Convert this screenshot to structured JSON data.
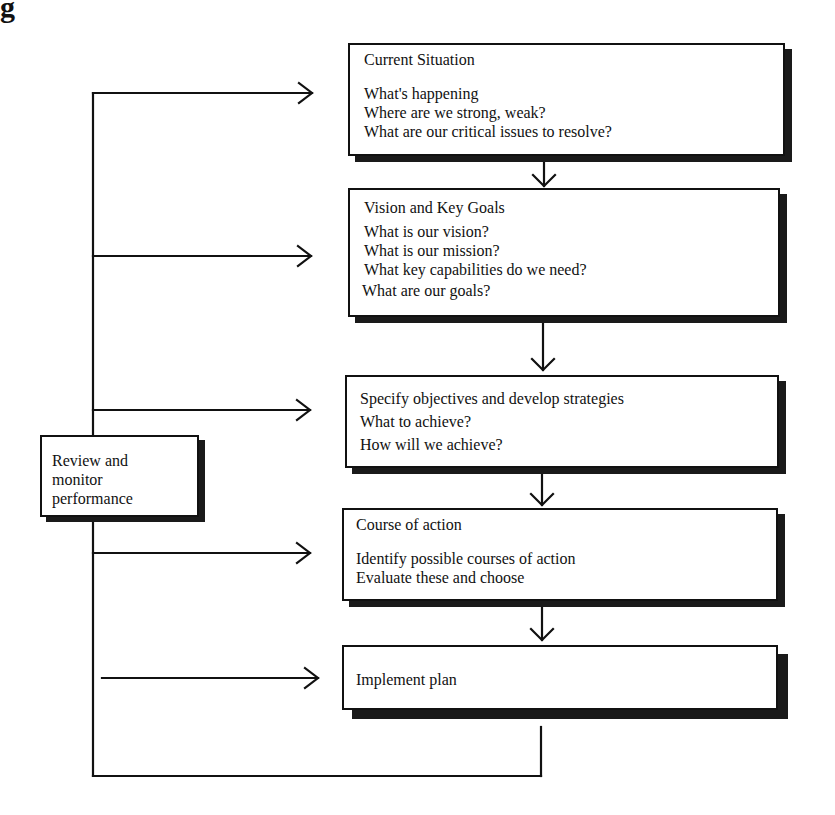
{
  "corner_fragment": "g",
  "review_box": {
    "lines": [
      "Review and",
      "monitor",
      "performance"
    ]
  },
  "steps": [
    {
      "title": "Current Situation",
      "items": [
        "What's happening",
        "Where are we strong, weak?",
        "What are our critical issues to resolve?"
      ]
    },
    {
      "title": "Vision and Key Goals",
      "items": [
        "What is our vision?",
        "What is our mission?",
        "What key capabilities do we need?",
        "What are our goals?"
      ]
    },
    {
      "title": "Specify objectives and develop strategies",
      "items": [
        "What to achieve?",
        "How will we achieve?"
      ]
    },
    {
      "title": "Course of action",
      "items": [
        "Identify possible courses of action",
        "Evaluate these and choose"
      ]
    },
    {
      "title": "Implement plan",
      "items": []
    }
  ],
  "colors": {
    "line": "#111111",
    "shadow": "#1a1a1a",
    "background": "#ffffff"
  }
}
